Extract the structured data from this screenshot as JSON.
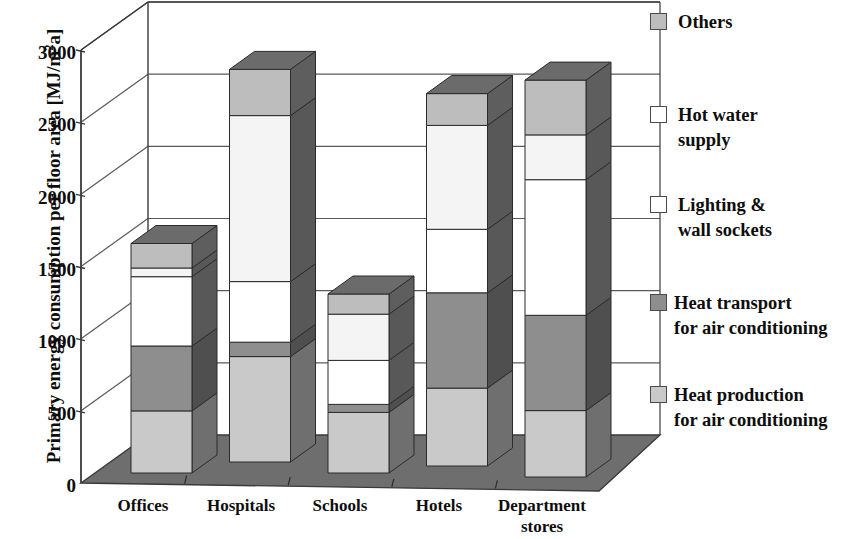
{
  "chart_data": {
    "type": "bar",
    "subtype": "stacked-3d-column",
    "title": "",
    "xlabel": "",
    "ylabel": "Primary energy consumption per floor area [MJ/m²a]",
    "ylabel_parts": {
      "main": "Primary energy consumption per floor area [MJ/m",
      "sup": "2",
      "tail": "a]"
    },
    "categories": [
      "Offices",
      "Hospitals",
      "Schools",
      "Hotels",
      "Department stores"
    ],
    "category_lines": [
      [
        "Offices"
      ],
      [
        "Hospitals"
      ],
      [
        "Schools"
      ],
      [
        "Hotels"
      ],
      [
        "Department",
        "stores"
      ]
    ],
    "ylim": [
      0,
      3000
    ],
    "yticks": [
      0,
      500,
      1000,
      1500,
      2000,
      2500,
      3000
    ],
    "ytick_labels": [
      "0",
      "500",
      "1000",
      "1500",
      "2000",
      "2500",
      "3000"
    ],
    "grid": true,
    "legend_position": "right",
    "series": [
      {
        "name": "Heat production for air conditioning",
        "color": "#c9c9c9",
        "side_color": "#6f6f6f",
        "top_color": "#8a8a8a",
        "values": [
          430,
          730,
          420,
          540,
          460
        ]
      },
      {
        "name": "Heat transport for air conditioning",
        "color": "#8e8e8e",
        "side_color": "#4f4f4f",
        "top_color": "#666666",
        "values": [
          450,
          100,
          55,
          660,
          660
        ]
      },
      {
        "name": "Lighting & wall sockets",
        "color": "#ffffff",
        "side_color": "#585858",
        "top_color": "#777777",
        "values": [
          480,
          420,
          305,
          440,
          940
        ]
      },
      {
        "name": "Hot water supply",
        "color": "#f4f4f4",
        "side_color": "#585858",
        "top_color": "#777777",
        "values": [
          60,
          1150,
          320,
          720,
          310
        ]
      },
      {
        "name": "Others",
        "color": "#bdbdbd",
        "side_color": "#5e5e5e",
        "top_color": "#6b6b6b",
        "values": [
          170,
          320,
          140,
          220,
          380
        ]
      }
    ],
    "totals": [
      1590,
      2720,
      1240,
      2580,
      2750
    ],
    "units": "MJ/m2a"
  },
  "legend": {
    "items": [
      {
        "label": "Others",
        "swatch": "#bdbdbd",
        "swatch_name": "legend-swatch-others"
      },
      {
        "label": "Hot water\nsupply",
        "swatch": "#ffffff",
        "swatch_name": "legend-swatch-hot-water-supply"
      },
      {
        "label": "Lighting &\nwall sockets",
        "swatch": "#ffffff",
        "swatch_name": "legend-swatch-lighting-wall-sockets"
      },
      {
        "label": "Heat transport\nfor air conditioning",
        "swatch": "#8e8e8e",
        "swatch_name": "legend-swatch-heat-transport"
      },
      {
        "label": "Heat  production\nfor air conditioning",
        "swatch": "#c9c9c9",
        "swatch_name": "legend-swatch-heat-production"
      }
    ]
  },
  "axes": {
    "y_title": "Primary energy consumption per floor area [MJ/m",
    "y_title_sup": "2",
    "y_title_tail": "a]"
  },
  "colors": {
    "floor": "#6e6e6e",
    "floor_edge": "#3a3a3a",
    "grid": "#5a5a5a",
    "axis": "#3a3a3a",
    "text": "#0d0d0d"
  }
}
